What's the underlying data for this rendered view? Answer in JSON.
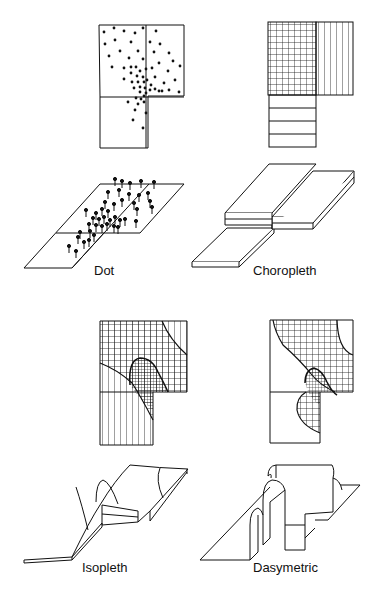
{
  "figure": {
    "ink_color": "#111111",
    "background_color": "#ffffff"
  },
  "panels": [
    {
      "id": "dot",
      "label": "Dot",
      "plan": "dot map with scattered points concentrated along the interior boundary",
      "isometric": "flat parallelogram with pin symbols"
    },
    {
      "id": "choropleth",
      "label": "Choropleth",
      "plan": "three enumeration units: dense crosshatch, vertical lines, horizontal lines",
      "isometric": "stepped prism slabs by unit"
    },
    {
      "id": "isopleth",
      "label": "Isopleth",
      "plan": "smooth isolines crossing unit boundaries with densest crosshatch in a tongue-shaped core",
      "isometric": "continuous smooth surface"
    },
    {
      "id": "dasymetric",
      "label": "Dasymetric",
      "plan": "zones bounded by curved lines reflecting underlying density with crosshatch core",
      "isometric": "stepped surface with curved walls"
    }
  ]
}
